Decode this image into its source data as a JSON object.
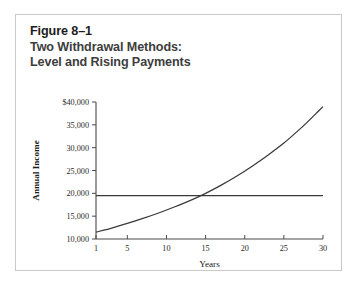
{
  "figure": {
    "title_line1": "Figure 8–1",
    "title_line2": "Two Withdrawal Methods:",
    "title_line3": "Level and Rising Payments",
    "border_color": "#c9c9c9",
    "background": "#ffffff"
  },
  "chart_data": {
    "type": "line",
    "title": "Two Withdrawal Methods: Level and Rising Payments",
    "xlabel": "Years",
    "ylabel": "Annual Income",
    "xlim": [
      1,
      30
    ],
    "ylim": [
      10000,
      40000
    ],
    "grid": false,
    "legend": "none",
    "xticks": [
      1,
      5,
      10,
      15,
      20,
      25,
      30
    ],
    "xtick_labels": [
      "1",
      "5",
      "10",
      "15",
      "20",
      "25",
      "30"
    ],
    "yticks": [
      10000,
      15000,
      20000,
      25000,
      30000,
      35000,
      40000
    ],
    "ytick_labels": [
      "10,000",
      "15,000",
      "20,000",
      "25,000",
      "30,000",
      "35,000",
      "$40,000"
    ],
    "line_color": "#3a3a3a",
    "series": [
      {
        "name": "Level Payments",
        "x": [
          1,
          30
        ],
        "values": [
          19500,
          19500
        ]
      },
      {
        "name": "Rising Payments",
        "x": [
          1,
          3,
          5,
          7,
          9,
          11,
          13,
          15,
          17,
          19,
          21,
          23,
          25,
          27,
          28,
          29,
          30
        ],
        "values": [
          11500,
          12400,
          13400,
          14500,
          15700,
          17000,
          18400,
          20000,
          21800,
          23800,
          26000,
          28400,
          31000,
          34000,
          35600,
          37300,
          39000
        ]
      }
    ]
  }
}
